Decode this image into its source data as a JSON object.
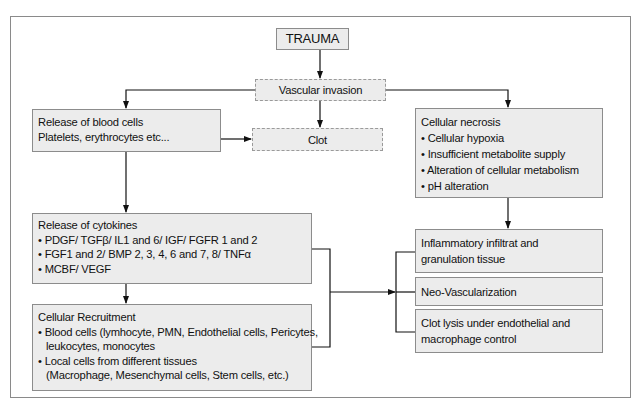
{
  "diagram": {
    "trauma": "TRAUMA",
    "vascular_invasion": "Vascular invasion",
    "clot": "Clot",
    "blood_cells": {
      "title": "Release of blood cells",
      "lines": [
        "Platelets, erythrocytes etc..."
      ]
    },
    "cytokines": {
      "title": "Release of cytokines",
      "bullets": [
        "PDGF/ TGFβ/ IL1 and 6/ IGF/ FGFR 1 and 2",
        "FGF1 and 2/ BMP 2, 3, 4, 6 and 7, 8/ TNFα",
        "MCBF/ VEGF"
      ]
    },
    "recruitment": {
      "title": "Cellular Recruitment",
      "bullets": [
        {
          "line1": "Blood cells (lymhocyte, PMN, Endothelial cells, Pericytes,",
          "line2": "leukocytes, monocytes"
        },
        {
          "line1": "Local cells from different tissues",
          "line2": "(Macrophage, Mesenchymal cells, Stem cells, etc.)"
        }
      ]
    },
    "necrosis": {
      "title": "Cellular necrosis",
      "bullets": [
        "Cellular hypoxia",
        "Insufficient metabolite supply",
        "Alteration of cellular metabolism",
        "pH alteration"
      ]
    },
    "outcomes": [
      {
        "line1": "Inflammatory infiltrat and",
        "line2": "granulation tissue"
      },
      {
        "line1": "Neo-Vascularization",
        "line2": ""
      },
      {
        "line1": "Clot lysis under endothelial and",
        "line2": "macrophage control"
      }
    ]
  },
  "colors": {
    "box_fill": "#ececec",
    "box_border": "#8c8c8c",
    "connector": "#111111",
    "frame_border": "#8a8a8a"
  }
}
